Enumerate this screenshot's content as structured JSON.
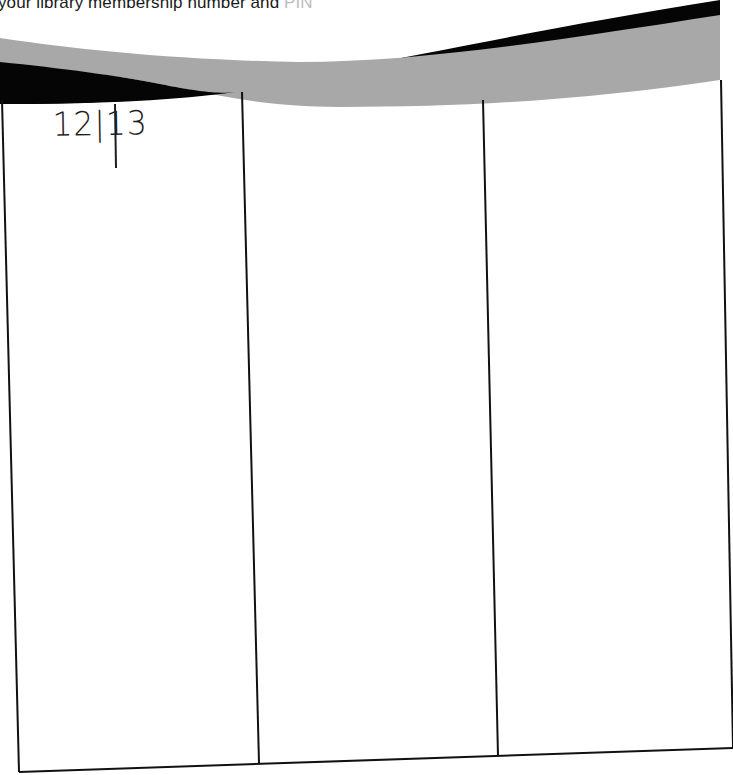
{
  "document": {
    "header_text": "your library membership number and",
    "header_text_faded": " PIN"
  },
  "wave_band": {
    "black": "#050505",
    "gray": "#a8a8a8"
  },
  "table": {
    "columns": 3,
    "cells": [
      {
        "column": 1,
        "handwritten": "12|13"
      },
      {
        "column": 2,
        "handwritten": ""
      },
      {
        "column": 3,
        "handwritten": ""
      }
    ]
  }
}
